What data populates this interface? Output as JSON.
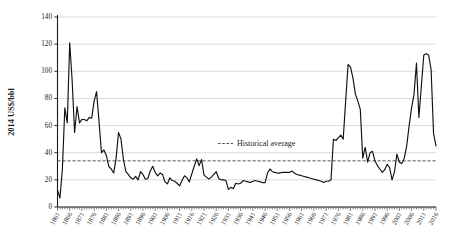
{
  "chart_data": {
    "type": "line",
    "title": "",
    "xlabel": "",
    "ylabel": "2014 US$/bbl",
    "xlim": [
      1861,
      2016
    ],
    "ylim": [
      0,
      140
    ],
    "ytick_labels": [
      "0",
      "20",
      "40",
      "60",
      "80",
      "100",
      "120",
      "140"
    ],
    "ytick_values": [
      0,
      20,
      40,
      60,
      80,
      100,
      120,
      140
    ],
    "xtick_labels": [
      "1861",
      "1866",
      "1871",
      "1876",
      "1881",
      "1886",
      "1891",
      "1896",
      "1901",
      "1906",
      "1911",
      "1916",
      "1921",
      "1926",
      "1931",
      "1936",
      "1941",
      "1946",
      "1951",
      "1956",
      "1961",
      "1966",
      "1971",
      "1976",
      "1981",
      "1986",
      "1991",
      "1996",
      "2001",
      "2006",
      "2011",
      "2016"
    ],
    "xtick_values": [
      1861,
      1866,
      1871,
      1876,
      1881,
      1886,
      1891,
      1896,
      1901,
      1906,
      1911,
      1916,
      1921,
      1926,
      1931,
      1936,
      1941,
      1946,
      1951,
      1956,
      1961,
      1966,
      1971,
      1976,
      1981,
      1986,
      1991,
      1996,
      2001,
      2006,
      2011,
      2016
    ],
    "grid": true,
    "grid_axis": "y",
    "legend_position": "inside-center",
    "legend": [
      {
        "name": "Historical average",
        "style": "dashed",
        "color": "#555555"
      }
    ],
    "annotations": {
      "historical_average_value": 34
    },
    "series": [
      {
        "name": "Crude oil price (2014 US$/bbl)",
        "color": "#111111",
        "style": "solid",
        "x": [
          1861,
          1862,
          1863,
          1864,
          1865,
          1866,
          1867,
          1868,
          1869,
          1870,
          1871,
          1872,
          1873,
          1874,
          1875,
          1876,
          1877,
          1878,
          1879,
          1880,
          1881,
          1882,
          1883,
          1884,
          1885,
          1886,
          1887,
          1888,
          1889,
          1890,
          1891,
          1892,
          1893,
          1894,
          1895,
          1896,
          1897,
          1898,
          1899,
          1900,
          1901,
          1902,
          1903,
          1904,
          1905,
          1906,
          1907,
          1908,
          1909,
          1910,
          1911,
          1912,
          1913,
          1914,
          1915,
          1916,
          1917,
          1918,
          1919,
          1920,
          1921,
          1922,
          1923,
          1924,
          1925,
          1926,
          1927,
          1928,
          1929,
          1930,
          1931,
          1932,
          1933,
          1934,
          1935,
          1936,
          1937,
          1938,
          1939,
          1940,
          1941,
          1942,
          1943,
          1944,
          1945,
          1946,
          1947,
          1948,
          1949,
          1950,
          1951,
          1952,
          1953,
          1954,
          1955,
          1956,
          1957,
          1958,
          1959,
          1960,
          1961,
          1962,
          1963,
          1964,
          1965,
          1966,
          1967,
          1968,
          1969,
          1970,
          1971,
          1972,
          1973,
          1974,
          1975,
          1976,
          1977,
          1978,
          1979,
          1980,
          1981,
          1982,
          1983,
          1984,
          1985,
          1986,
          1987,
          1988,
          1989,
          1990,
          1991,
          1992,
          1993,
          1994,
          1995,
          1996,
          1997,
          1998,
          1999,
          2000,
          2001,
          2002,
          2003,
          2004,
          2005,
          2006,
          2007,
          2008,
          2009,
          2010,
          2011,
          2012,
          2013,
          2014,
          2015,
          2016
        ],
        "values": [
          12.5,
          6.5,
          28.0,
          73.0,
          62.0,
          121.0,
          93.0,
          55.0,
          74.0,
          62.0,
          64.5,
          64.5,
          63.5,
          66.0,
          65.5,
          78.0,
          85.0,
          63.0,
          40.0,
          42.0,
          38.0,
          30.0,
          28.0,
          25.0,
          36.0,
          55.0,
          50.0,
          35.0,
          26.0,
          24.0,
          21.5,
          20.5,
          22.5,
          20.0,
          26.0,
          24.0,
          20.5,
          21.0,
          26.5,
          30.0,
          25.5,
          23.0,
          25.0,
          24.0,
          18.5,
          17.0,
          21.5,
          19.5,
          19.0,
          17.5,
          15.5,
          19.5,
          23.0,
          21.5,
          18.5,
          24.5,
          30.0,
          35.5,
          30.5,
          35.0,
          23.5,
          22.0,
          20.5,
          22.0,
          24.0,
          26.0,
          21.0,
          20.0,
          20.0,
          19.5,
          13.0,
          14.5,
          13.5,
          17.5,
          17.0,
          17.5,
          19.5,
          19.0,
          18.5,
          18.0,
          19.0,
          19.5,
          19.0,
          18.5,
          18.0,
          18.0,
          25.0,
          28.0,
          26.0,
          25.5,
          25.0,
          25.0,
          25.5,
          25.5,
          25.5,
          25.5,
          26.5,
          25.0,
          24.0,
          23.5,
          23.0,
          22.5,
          22.0,
          21.5,
          21.0,
          20.5,
          20.0,
          19.5,
          19.0,
          18.0,
          19.0,
          19.0,
          20.0,
          50.0,
          49.0,
          51.0,
          53.0,
          50.0,
          78.0,
          105.0,
          103.0,
          95.0,
          83.0,
          78.0,
          72.0,
          36.0,
          44.0,
          33.0,
          40.0,
          41.0,
          34.0,
          30.5,
          28.0,
          25.5,
          27.5,
          31.5,
          29.0,
          20.0,
          26.0,
          39.0,
          33.0,
          32.0,
          36.0,
          45.0,
          60.0,
          73.0,
          83.0,
          106.0,
          66.0,
          89.0,
          112.0,
          113.0,
          112.0,
          101.0,
          54.0,
          45.0
        ]
      }
    ]
  },
  "axes": {
    "y_title": "2014 US$/bbl"
  },
  "legend": {
    "historical_average_label": "Historical average"
  }
}
